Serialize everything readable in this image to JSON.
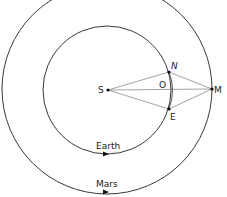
{
  "diagram": {
    "points": {
      "S": {
        "label": "S"
      },
      "N": {
        "label": "N"
      },
      "E": {
        "label": "E"
      },
      "M": {
        "label": "M"
      },
      "O": {
        "label": "O"
      }
    },
    "orbits": [
      {
        "name": "Earth",
        "label": "Earth"
      },
      {
        "name": "Mars",
        "label": "Mars"
      }
    ],
    "colors": {
      "line": "#222222",
      "thin_line": "#555555",
      "background": "#ffffff"
    }
  }
}
